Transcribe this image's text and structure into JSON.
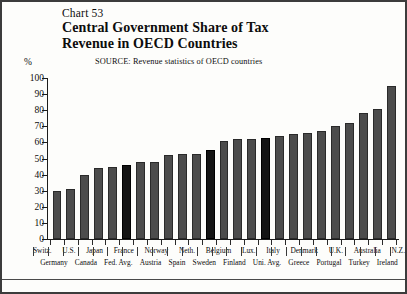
{
  "figure": {
    "chart_number": "Chart 53",
    "title_line1": "Central Government Share of Tax",
    "title_line2": "Revenue in OECD Countries",
    "source": "SOURCE:  Revenue statistics of OECD countries",
    "percent_symbol": "%"
  },
  "chart_data": {
    "type": "bar",
    "title": "Central Government Share of Tax Revenue in OECD Countries",
    "subtitle": "Chart 53",
    "source": "SOURCE:  Revenue statistics of OECD countries",
    "xlabel": "",
    "ylabel": "%",
    "ylim": [
      0,
      100
    ],
    "yticks": [
      0,
      10,
      20,
      30,
      40,
      50,
      60,
      70,
      80,
      90,
      100
    ],
    "ytick_labels": [
      "0",
      "10",
      "20",
      "30",
      "40",
      "50",
      "60",
      "70",
      "80",
      "90",
      "100"
    ],
    "grid": false,
    "legend": "none",
    "label_row_top": [
      "Switz.",
      "",
      "U.S.",
      "",
      "Japan",
      "",
      "France",
      "",
      "Norway",
      "",
      "Neth.",
      "",
      "Belgium",
      "",
      "Lux.",
      "",
      "Italy",
      "",
      "Denmark",
      "",
      "U.K.",
      "",
      "Australia",
      "",
      "N.Z."
    ],
    "label_row_bottom": [
      "",
      "Germany",
      "",
      "Canada",
      "",
      "Fed. Avg.",
      "",
      "Austria",
      "",
      "Spain",
      "",
      "Sweden",
      "",
      "Finland",
      "",
      "Uni. Avg.",
      "",
      "Greece",
      "",
      "Portugal",
      "",
      "Turkey",
      "",
      "Ireland",
      ""
    ],
    "categories": [
      "Switz.",
      "Germany",
      "U.S.",
      "Canada",
      "Japan",
      "Fed. Avg.",
      "France",
      "Austria",
      "Norway",
      "Spain",
      "Neth.",
      "Sweden",
      "Belgium",
      "Finland",
      "Lux.",
      "Uni. Avg.",
      "Italy",
      "Greece",
      "Denmark",
      "Portugal",
      "U.K.",
      "Turkey",
      "Australia",
      "Ireland",
      "N.Z."
    ],
    "values": [
      30,
      31,
      40,
      44,
      45,
      46,
      48,
      48,
      52,
      53,
      53,
      55,
      61,
      62,
      62,
      63,
      64,
      65,
      66,
      67,
      70,
      72,
      78,
      81,
      95
    ],
    "highlighted": [
      "Fed. Avg.",
      "Sweden",
      "Uni. Avg."
    ],
    "colors": {
      "bar": "#4c4c4c",
      "bar_highlight": "#141414",
      "axis": "#1c1c1c",
      "background": "#fdfdfb"
    }
  }
}
